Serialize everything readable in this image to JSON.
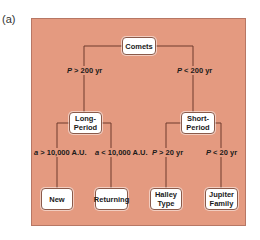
{
  "figure_label": "(a)",
  "colors": {
    "panel_background": "#e49a80",
    "panel_border": "#b77764",
    "line_color": "#6e3a2c",
    "node_background": "#ffffff",
    "node_border": "#8a5a4a"
  },
  "tree": {
    "root": {
      "label": "Comets"
    },
    "branches": [
      {
        "condition_var": "P",
        "condition_rest": " > 200 yr",
        "node": {
          "line1": "Long-",
          "line2": "Period"
        },
        "children": [
          {
            "condition_var": "a",
            "condition_rest": " > 10,000 A.U.",
            "line1": "New",
            "line2": ""
          },
          {
            "condition_var": "a",
            "condition_rest": " < 10,000 A.U.",
            "line1": "Returning",
            "line2": ""
          }
        ]
      },
      {
        "condition_var": "P",
        "condition_rest": " < 200 yr",
        "node": {
          "line1": "Short-",
          "line2": "Period"
        },
        "children": [
          {
            "condition_var": "P",
            "condition_rest": " > 20 yr",
            "line1": "Halley",
            "line2": "Type"
          },
          {
            "condition_var": "P",
            "condition_rest": " < 20 yr",
            "line1": "Jupiter",
            "line2": "Family"
          }
        ]
      }
    ]
  }
}
